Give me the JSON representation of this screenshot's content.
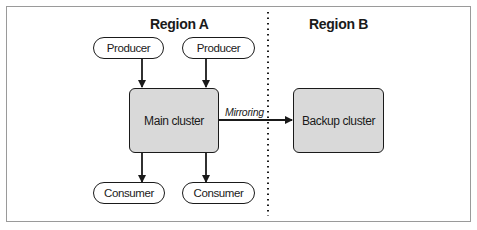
{
  "diagram": {
    "regions": [
      {
        "label": "Region A"
      },
      {
        "label": "Region B"
      }
    ],
    "producers": [
      {
        "label": "Producer"
      },
      {
        "label": "Producer"
      }
    ],
    "consumers": [
      {
        "label": "Consumer"
      },
      {
        "label": "Consumer"
      }
    ],
    "main_cluster": {
      "label": "Main cluster"
    },
    "backup_cluster": {
      "label": "Backup cluster"
    },
    "link": {
      "label": "Mirroring"
    },
    "colors": {
      "cluster_fill": "#d9d9d9",
      "stroke": "#1a1a1a",
      "frame": "#9a9a9a"
    }
  }
}
